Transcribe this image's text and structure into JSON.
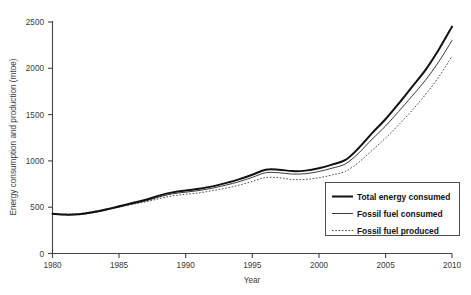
{
  "chart_data": {
    "type": "line",
    "title": "",
    "xlabel": "Year",
    "ylabel": "Energy consumption and production (mtoe)",
    "xlim": [
      1980,
      2010
    ],
    "ylim": [
      0,
      2500
    ],
    "xticks": [
      1980,
      1985,
      1990,
      1995,
      2000,
      2005,
      2010
    ],
    "yticks": [
      0,
      500,
      1000,
      1500,
      2000,
      2500
    ],
    "grid": false,
    "legend_position": "bottom-right",
    "x": [
      1980,
      1981,
      1982,
      1983,
      1984,
      1985,
      1986,
      1987,
      1988,
      1989,
      1990,
      1991,
      1992,
      1993,
      1994,
      1995,
      1996,
      1997,
      1998,
      1999,
      2000,
      2001,
      2002,
      2003,
      2004,
      2005,
      2006,
      2007,
      2008,
      2009,
      2010
    ],
    "series": [
      {
        "name": "Total energy consumed",
        "style": "thick-solid",
        "color": "#111111",
        "values": [
          430,
          420,
          425,
          445,
          475,
          510,
          545,
          580,
          625,
          660,
          680,
          700,
          725,
          760,
          800,
          850,
          905,
          905,
          890,
          895,
          920,
          960,
          1010,
          1140,
          1300,
          1450,
          1620,
          1800,
          1980,
          2200,
          2450
        ]
      },
      {
        "name": "Fossil fuel consumed",
        "style": "thin-solid",
        "color": "#222222",
        "values": [
          428,
          418,
          422,
          440,
          468,
          500,
          535,
          568,
          610,
          645,
          662,
          680,
          705,
          738,
          775,
          822,
          872,
          872,
          858,
          862,
          885,
          922,
          968,
          1085,
          1235,
          1375,
          1535,
          1700,
          1870,
          2070,
          2300
        ]
      },
      {
        "name": "Fossil fuel produced",
        "style": "dotted",
        "color": "#4a4a4a",
        "values": [
          430,
          423,
          432,
          452,
          478,
          505,
          532,
          558,
          592,
          622,
          640,
          655,
          678,
          705,
          738,
          778,
          820,
          818,
          800,
          800,
          818,
          848,
          888,
          985,
          1115,
          1245,
          1390,
          1545,
          1715,
          1905,
          2130
        ]
      }
    ]
  },
  "axes": {
    "x_tick_labels": [
      "1980",
      "1985",
      "1990",
      "1995",
      "2000",
      "2005",
      "2010"
    ],
    "y_tick_labels": [
      "0",
      "500",
      "1000",
      "1500",
      "2000",
      "2500"
    ],
    "x_title": "Year",
    "y_title": "Energy consumption and production (mtoe)"
  },
  "legend": {
    "items": [
      {
        "label": "Total energy consumed",
        "style": "thick-solid"
      },
      {
        "label": "Fossil fuel consumed",
        "style": "thin-solid"
      },
      {
        "label": "Fossil fuel produced",
        "style": "dotted"
      }
    ]
  }
}
